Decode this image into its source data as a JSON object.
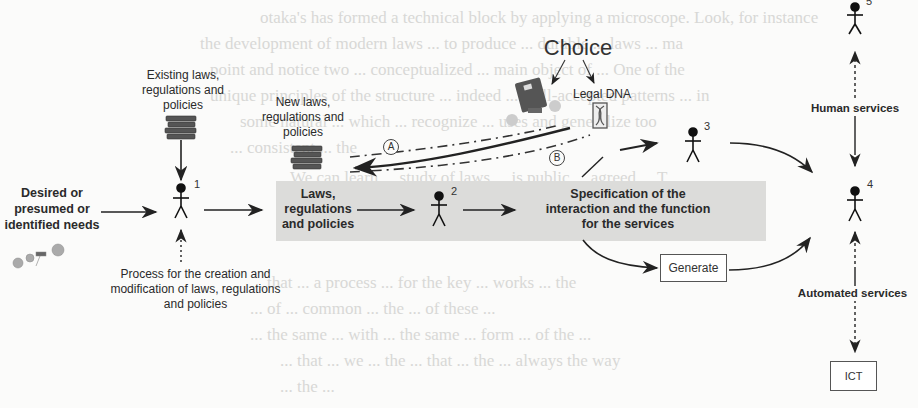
{
  "background_bleed_lines": [
    "otaka's has formed a technical block by applying a microscope. Look, for instance",
    "the development of modern laws ... to produce ... durable ... laws ... ma",
    "point and notice two ... conceptualized ... main object of ... One of the",
    "unique principles of the structure ... indeed ... well-accepted patterns ... in",
    "some natural ... which ... recognize ... uses and generalize too",
    "... consistent ... the",
    "We can learn ... study of laws ... is public ... agreed ... T",
    "... that ... a process ... for the key ... works ... the",
    "... of ... common ... the ... of these ...",
    "... the same ... with ... the same ... form ... of the ...",
    "... that ... we ... the ... that ... the ... always the way",
    "... the ..."
  ],
  "diagram": {
    "inputs": {
      "needs_label": "Desired or presumed or identified needs",
      "existing_laws_label": "Existing laws, regulations and policies",
      "process_label": "Process for the creation and modification of laws, regulations and policies",
      "new_laws_label": "New laws, regulations and policies"
    },
    "choice": {
      "title": "Choice",
      "legal_dna_label": "Legal DNA",
      "path_a": "A",
      "path_b": "B"
    },
    "band": {
      "laws_label": "Laws, regulations and policies",
      "spec_label": "Specification of the interaction and the function for the services"
    },
    "actors": [
      {
        "id": "1",
        "label": "1"
      },
      {
        "id": "2",
        "label": "2"
      },
      {
        "id": "3",
        "label": "3"
      },
      {
        "id": "4",
        "label": "4"
      },
      {
        "id": "5",
        "label": "5"
      }
    ],
    "generate_label": "Generate",
    "human_services_label": "Human services",
    "automated_services_label": "Automated services",
    "ict_label": "ICT",
    "icons": [
      "books-stack-icon",
      "books-stack-icon",
      "person-icon",
      "people-group-icon",
      "law-book-icon",
      "dna-helix-icon"
    ]
  }
}
